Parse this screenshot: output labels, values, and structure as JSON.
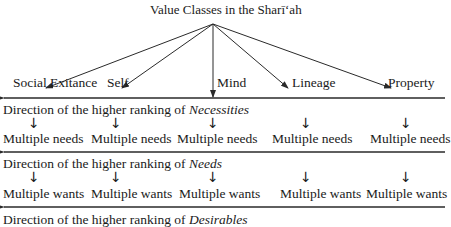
{
  "title": "Value Classes in the Sharī‘ah",
  "categories": [
    {
      "label": "Social Exitance"
    },
    {
      "label": "Self"
    },
    {
      "label": "Mind"
    },
    {
      "label": "Lineage"
    },
    {
      "label": "Property"
    }
  ],
  "levels": [
    {
      "direction_prefix": "Direction of the higher ranking of ",
      "direction_term": "Necessities",
      "items": [
        "Multiple needs",
        "Multiple needs",
        "Multiple needs",
        "Multiple needs",
        "Multiple needs"
      ]
    },
    {
      "direction_prefix": "Direction of the higher ranking of ",
      "direction_term": "Needs",
      "items": [
        "Multiple wants",
        "Multiple wants",
        "Multiple wants",
        "Multiple wants",
        "Multiple wants"
      ]
    },
    {
      "direction_prefix": "Direction of the higher ranking of ",
      "direction_term": "Desirables",
      "items": []
    }
  ],
  "down_arrow_glyph": "↓",
  "colors": {
    "line": "#2a2a2a",
    "text": "#1a1a1a",
    "background": "#ffffff"
  }
}
